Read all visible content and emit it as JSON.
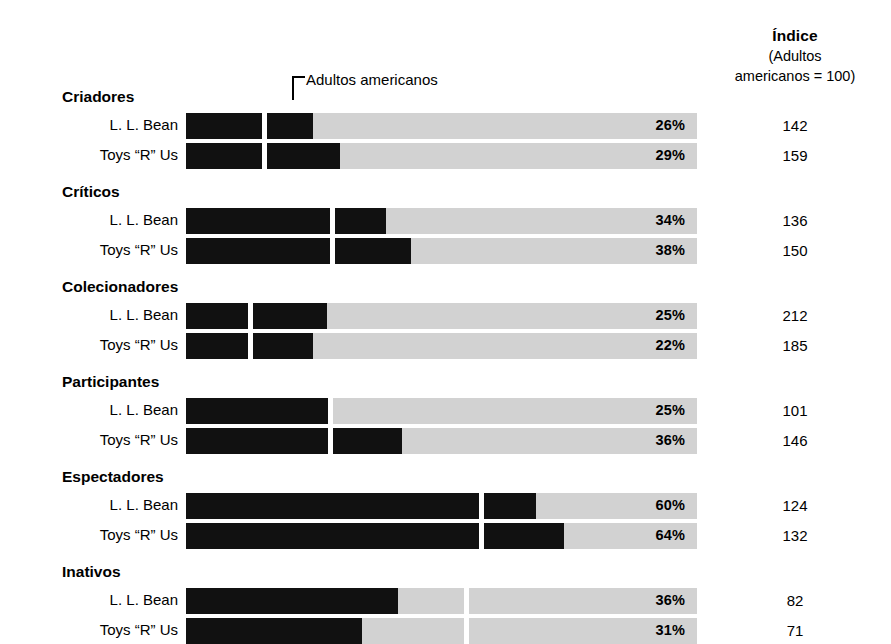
{
  "index_header": {
    "title": "Índice",
    "sub_line1": "(Adultos",
    "sub_line2": "americanos = 100)"
  },
  "reference_callout": {
    "label": "Adultos americanos"
  },
  "series_labels": {
    "a": "L. L. Bean",
    "b": "Toys “R” Us"
  },
  "colors": {
    "bar_fill": "#111111",
    "bar_track": "#d2d2d2",
    "gap": "#ffffff",
    "text": "#000000"
  },
  "chart_data": {
    "type": "bar",
    "title": "Índice (Adultos americanos = 100)",
    "xlabel": "",
    "ylabel": "",
    "orientation": "horizontal",
    "grid": false,
    "legend_position": "none",
    "value_unit": "%",
    "reference_label": "Adultos americanos",
    "reference_index": 100,
    "axis_max_percent": 86,
    "categories": [
      "Criadores",
      "Críticos",
      "Colecionadores",
      "Participantes",
      "Espectadores",
      "Inativos"
    ],
    "series": [
      {
        "name": "L. L. Bean",
        "values": [
          26,
          34,
          25,
          25,
          60,
          36
        ],
        "index": [
          142,
          136,
          212,
          101,
          124,
          82
        ]
      },
      {
        "name": "Toys “R” Us",
        "values": [
          29,
          38,
          22,
          36,
          64,
          31
        ],
        "index": [
          159,
          150,
          185,
          146,
          132,
          71
        ]
      }
    ],
    "groups": [
      {
        "heading": "Criadores",
        "rows": [
          {
            "label": "L. L. Bean",
            "percent": 26,
            "percent_text": "26%",
            "index_text": "142",
            "bar_pct": 21.4,
            "gap_pct": 13.2
          },
          {
            "label": "Toys “R” Us",
            "percent": 29,
            "percent_text": "29%",
            "index_text": "159",
            "bar_pct": 26.0,
            "gap_pct": 13.2
          }
        ]
      },
      {
        "heading": "Críticos",
        "rows": [
          {
            "label": "L. L. Bean",
            "percent": 34,
            "percent_text": "34%",
            "index_text": "136",
            "bar_pct": 33.7,
            "gap_pct": 24.5
          },
          {
            "label": "Toys “R” Us",
            "percent": 38,
            "percent_text": "38%",
            "index_text": "150",
            "bar_pct": 37.9,
            "gap_pct": 24.5
          }
        ]
      },
      {
        "heading": "Colecionadores",
        "rows": [
          {
            "label": "L. L. Bean",
            "percent": 25,
            "percent_text": "25%",
            "index_text": "212",
            "bar_pct": 23.7,
            "gap_pct": 10.8
          },
          {
            "label": "Toys “R” Us",
            "percent": 22,
            "percent_text": "22%",
            "index_text": "185",
            "bar_pct": 21.3,
            "gap_pct": 10.8
          }
        ]
      },
      {
        "heading": "Participantes",
        "rows": [
          {
            "label": "L. L. Bean",
            "percent": 25,
            "percent_text": "25%",
            "index_text": "101",
            "bar_pct": 24.3,
            "gap_pct": 24.3
          },
          {
            "label": "Toys “R” Us",
            "percent": 36,
            "percent_text": "36%",
            "index_text": "146",
            "bar_pct": 36.4,
            "gap_pct": 24.3
          }
        ]
      },
      {
        "heading": "Espectadores",
        "rows": [
          {
            "label": "L. L. Bean",
            "percent": 60,
            "percent_text": "60%",
            "index_text": "124",
            "bar_pct": 58.9,
            "gap_pct": 49.7
          },
          {
            "label": "Toys “R” Us",
            "percent": 64,
            "percent_text": "64%",
            "index_text": "132",
            "bar_pct": 63.6,
            "gap_pct": 49.7
          }
        ]
      },
      {
        "heading": "Inativos",
        "rows": [
          {
            "label": "L. L. Bean",
            "percent": 36,
            "percent_text": "36%",
            "index_text": "82",
            "bar_pct": 35.6,
            "gap_pct": 47.2
          },
          {
            "label": "Toys “R” Us",
            "percent": 31,
            "percent_text": "31%",
            "index_text": "71",
            "bar_pct": 29.7,
            "gap_pct": 47.2
          }
        ]
      }
    ]
  }
}
